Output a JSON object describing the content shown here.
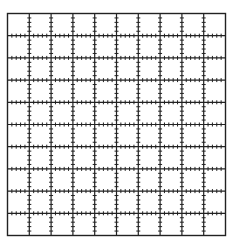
{
  "canvas": {
    "width": 233,
    "height": 246,
    "background": "#ffffff"
  },
  "grid": {
    "left": 7.5,
    "top": 13.5,
    "right": 225.5,
    "bottom": 235.5,
    "columns": 10,
    "rows": 10,
    "line_color": "#222222",
    "line_width": 1.2,
    "border_width": 1.4,
    "ticks_per_cell": 4,
    "tick_half_length": 2
  }
}
